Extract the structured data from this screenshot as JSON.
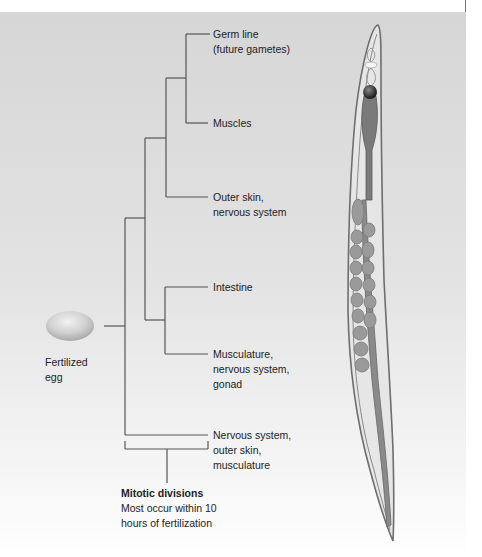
{
  "figure": {
    "egg_label": [
      "Fertilized",
      "egg"
    ],
    "branches": [
      {
        "id": "germ-line",
        "lines": [
          "Germ line",
          "(future gametes)"
        ]
      },
      {
        "id": "muscles",
        "lines": [
          "Muscles"
        ]
      },
      {
        "id": "outer-skin",
        "lines": [
          "Outer skin,",
          "nervous system"
        ]
      },
      {
        "id": "intestine",
        "lines": [
          "Intestine"
        ]
      },
      {
        "id": "musculature",
        "lines": [
          "Musculature,",
          "nervous system,",
          "gonad"
        ]
      },
      {
        "id": "nervous-system",
        "lines": [
          "Nervous system,",
          "outer skin,",
          "musculature"
        ]
      }
    ],
    "caption": {
      "title": "Mitotic divisions",
      "lines": [
        "Most occur within 10",
        "hours of fertilization"
      ]
    },
    "organism": "nematode-worm-illustration"
  },
  "colors": {
    "line": "#555555",
    "text": "#222222",
    "worm_outline": "#6e6e6e",
    "worm_fill": "#8a8a8a",
    "egg": "#c8c8c8"
  }
}
